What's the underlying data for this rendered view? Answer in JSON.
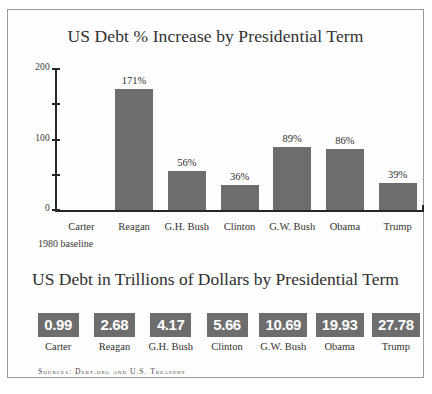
{
  "chart_data": [
    {
      "type": "bar",
      "title": "US Debt % Increase by Presidential Term",
      "xlabel": "",
      "ylabel": "",
      "ylim": [
        0,
        200
      ],
      "yticks": [
        0,
        50,
        100,
        150,
        200
      ],
      "ytick_labels": [
        "0",
        "",
        "100",
        "",
        "200"
      ],
      "grid": false,
      "legend": "none",
      "categories": [
        "Carter",
        "Reagan",
        "G.H. Bush",
        "Clinton",
        "G.W. Bush",
        "Obama",
        "Trump"
      ],
      "values": [
        null,
        171,
        56,
        36,
        89,
        86,
        39
      ],
      "data_labels": [
        "",
        "171%",
        "56%",
        "36%",
        "89%",
        "86%",
        "39%"
      ],
      "annotation": "1980 baseline",
      "bar_color": "#6d6d6d"
    },
    {
      "type": "table",
      "title": "US Debt in Trillions of Dollars by Presidential Term",
      "categories": [
        "Carter",
        "Reagan",
        "G.H. Bush",
        "Clinton",
        "G.W. Bush",
        "Obama",
        "Trump"
      ],
      "values": [
        0.99,
        2.68,
        4.17,
        5.66,
        10.69,
        19.93,
        27.78
      ],
      "value_labels": [
        "0.99",
        "2.68",
        "4.17",
        "5.66",
        "10.69",
        "19.93",
        "27.78"
      ],
      "box_color": "#6d6d6d",
      "box_text_color": "#ffffff"
    }
  ],
  "sources": "Sources: Debt.org and U.S. Treasury"
}
